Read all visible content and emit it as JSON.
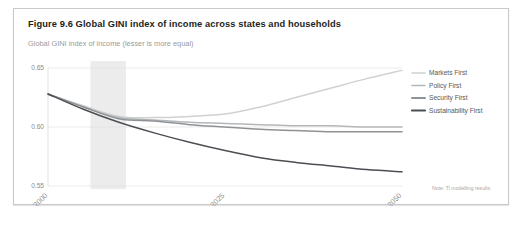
{
  "figure": {
    "title": "Figure 9.6 Global GINI index of income across states and households",
    "subtitle": "Global GINI index of income (lesser is more equal)",
    "note": "Note: Ti modelling results"
  },
  "legend": {
    "position": "right",
    "items": [
      {
        "label": "Markets First",
        "color": "#cfd1d2"
      },
      {
        "label": "Policy First",
        "color": "#b4b7b9"
      },
      {
        "label": "Security First",
        "color": "#8f9295"
      },
      {
        "label": "Sustainability First",
        "color": "#4b4f53"
      }
    ]
  },
  "axes": {
    "y_ticks": [
      "0.65",
      "0.60",
      "0.55"
    ],
    "x_ticks": [
      "2000",
      "2025",
      "2050"
    ]
  },
  "chart_data": {
    "type": "line",
    "title": "Global GINI index of income across states and households",
    "subtitle": "Global GINI index of income (lesser is more equal)",
    "xlabel": "",
    "ylabel": "Global GINI index of income (lesser is more equal)",
    "xlim": [
      2000,
      2050
    ],
    "ylim": [
      0.55,
      0.65
    ],
    "yticks": [
      0.55,
      0.6,
      0.65
    ],
    "xticks": [
      2000,
      2025,
      2050
    ],
    "grid": "horizontal",
    "legend_position": "right",
    "shaded_band": {
      "x0": 2006,
      "x1": 2011,
      "color": "#ececec"
    },
    "x": [
      2000,
      2005,
      2010,
      2015,
      2020,
      2025,
      2030,
      2035,
      2040,
      2045,
      2050
    ],
    "series": [
      {
        "name": "Markets First",
        "color": "#cfd1d2",
        "values": [
          0.628,
          0.618,
          0.609,
          0.608,
          0.609,
          0.611,
          0.617,
          0.625,
          0.633,
          0.641,
          0.648
        ]
      },
      {
        "name": "Policy First",
        "color": "#b4b7b9",
        "values": [
          0.628,
          0.617,
          0.608,
          0.606,
          0.604,
          0.603,
          0.602,
          0.601,
          0.601,
          0.6,
          0.6
        ]
      },
      {
        "name": "Security First",
        "color": "#8f9295",
        "values": [
          0.628,
          0.617,
          0.607,
          0.605,
          0.602,
          0.6,
          0.598,
          0.597,
          0.596,
          0.596,
          0.596
        ]
      },
      {
        "name": "Sustainability First",
        "color": "#4b4f53",
        "values": [
          0.628,
          0.615,
          0.604,
          0.595,
          0.587,
          0.58,
          0.574,
          0.57,
          0.567,
          0.564,
          0.562
        ]
      }
    ]
  }
}
